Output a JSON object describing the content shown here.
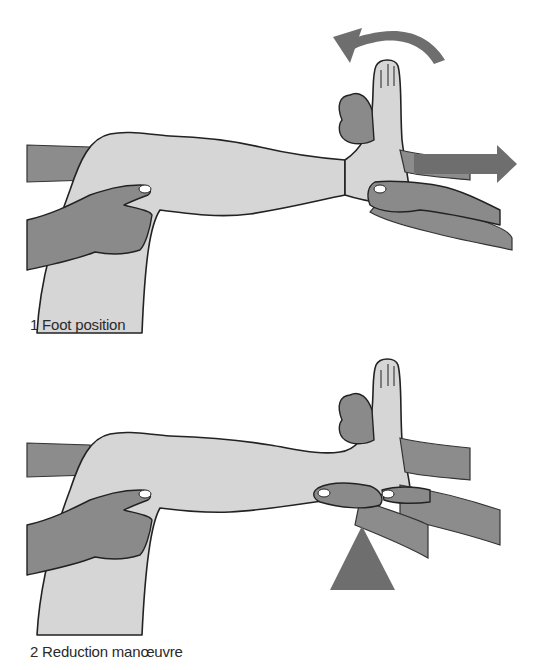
{
  "figure": {
    "panels": [
      {
        "number": "1",
        "caption": "1  Foot position",
        "arrows": [
          "curved-rotation-arrow",
          "traction-arrow-right"
        ]
      },
      {
        "number": "2",
        "caption": "2  Reduction manœuvre",
        "arrows": [
          "upward-push-arrow"
        ]
      }
    ],
    "colors": {
      "skin": "#d6d6d6",
      "hands": "#8a8a8a",
      "arrows": "#6e6e6e",
      "outline": "#222222",
      "background": "#ffffff"
    }
  }
}
